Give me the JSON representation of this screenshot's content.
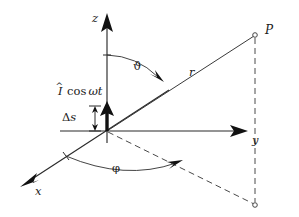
{
  "figure": {
    "kind": "hertzian-dipole-spherical-coordinates-diagram",
    "background_color": "#ffffff",
    "line_color": "#2a2a2a",
    "dashed_color": "#4a4a4a",
    "dipole_color": "#111111",
    "width": 299,
    "height": 217
  },
  "axes": [
    {
      "id": "z",
      "label": "z",
      "direction": "up",
      "origin": [
        107,
        131
      ],
      "tip": [
        107,
        14
      ]
    },
    {
      "id": "y",
      "label": "y",
      "direction": "right",
      "origin": [
        107,
        131
      ],
      "tip": [
        244,
        131
      ]
    },
    {
      "id": "x",
      "label": "x",
      "direction": "down-left",
      "origin": [
        107,
        131
      ],
      "tip": [
        22,
        186
      ]
    }
  ],
  "points": [
    {
      "id": "P",
      "label": "P",
      "coords": [
        255,
        35
      ],
      "marker": "open-circle"
    },
    {
      "id": "P-projection",
      "label": "",
      "coords": [
        255,
        205
      ],
      "marker": "open-circle"
    }
  ],
  "vectors": [
    {
      "id": "r",
      "label": "r",
      "from": [
        107,
        131
      ],
      "to": [
        255,
        35
      ],
      "style": "solid"
    }
  ],
  "angles": [
    {
      "id": "theta",
      "label": "ϑ",
      "between": [
        "z-axis",
        "r"
      ],
      "arrow": "to-r"
    },
    {
      "id": "phi",
      "label": "φ",
      "between": [
        "x-axis",
        "xy-projection"
      ],
      "arrow": "to-projection"
    }
  ],
  "source": {
    "id": "current-element",
    "current_label_hat": "I",
    "current_label_rest": "cos",
    "current_label_omega": "ωt",
    "current_label_full": "Î cos ωt",
    "length_label_delta": "Δ",
    "length_label_s": "s",
    "length_label_full": "Δs",
    "arrow_direction": "up-along-z"
  },
  "dashed_elements": [
    {
      "id": "xy-projection-ray",
      "from": [
        107,
        131
      ],
      "to": [
        255,
        205
      ]
    },
    {
      "id": "vertical-drop",
      "from": [
        255,
        35
      ],
      "to": [
        255,
        205
      ]
    }
  ]
}
